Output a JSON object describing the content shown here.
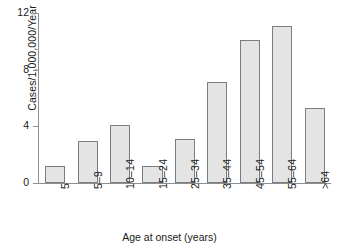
{
  "chart_data": {
    "type": "bar",
    "title": "",
    "subtitle": "",
    "xlabel": "Age at onset (years)",
    "ylabel": "Cases/1,000,000/Year",
    "categories": [
      "5",
      "5–9",
      "10–14",
      "15–24",
      "25–34",
      "35–44",
      "45–54",
      "55–64",
      ">64"
    ],
    "values": [
      1.2,
      3.0,
      4.1,
      1.2,
      3.1,
      7.1,
      10.1,
      11.1,
      5.3
    ],
    "ylim": [
      0,
      12
    ],
    "yticks": [
      "0",
      "4",
      "8",
      "12"
    ],
    "ytick_values": [
      0,
      4,
      8,
      12
    ],
    "grid": false,
    "legend": false,
    "legend_position": "none",
    "bar_fill": "#e4e4e4",
    "bar_edge": "#7d7d7d",
    "axis_color": "#8e8e8e",
    "background": "#ffffff",
    "xtick_rotation": 90
  }
}
